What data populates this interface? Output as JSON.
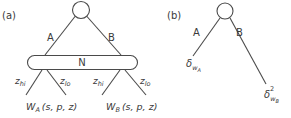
{
  "panel_a": {
    "label": "(a)",
    "root_node": {
      "shape": "circle"
    },
    "edges": {
      "left": "A",
      "right": "B"
    },
    "group_node": {
      "label": "N",
      "shape": "rounded-rectangle"
    },
    "left_subtree": {
      "edge_left": {
        "base": "z",
        "sub": "hi"
      },
      "edge_right": {
        "base": "z",
        "sub": "lo"
      },
      "leaf": {
        "base": "W",
        "sub": "A",
        "args": "(s, p, z)"
      }
    },
    "right_subtree": {
      "edge_left": {
        "base": "z",
        "sub": "hi"
      },
      "edge_right": {
        "base": "z",
        "sub": "lo"
      },
      "leaf": {
        "base": "W",
        "sub": "B",
        "args": "(s, p, z)"
      }
    }
  },
  "panel_b": {
    "label": "(b)",
    "root_node": {
      "shape": "circle"
    },
    "edges": {
      "left": "A",
      "right": "B"
    },
    "leaf_left": {
      "base": "δ",
      "sub": "w",
      "subsub": "A"
    },
    "leaf_right": {
      "base": "δ",
      "sup": "2",
      "sub": "w",
      "subsub": "B"
    }
  },
  "colors": {
    "stroke": "#4a4a4a",
    "text": "#3a3a3a",
    "background": "#ffffff"
  }
}
